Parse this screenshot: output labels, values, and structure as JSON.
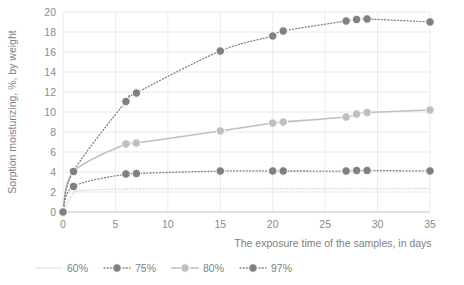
{
  "chart_data": {
    "type": "scatter",
    "title": "",
    "xlabel": "The exposure time of the samples, in days",
    "ylabel": "Sorption moisturizing, %, by weight",
    "xlim": [
      0,
      35
    ],
    "ylim": [
      0,
      20
    ],
    "xticks": [
      0,
      5,
      10,
      15,
      20,
      25,
      30,
      35
    ],
    "yticks": [
      0,
      2,
      4,
      6,
      8,
      10,
      12,
      14,
      16,
      18,
      20
    ],
    "grid": true,
    "legend_position": "bottom",
    "series": [
      {
        "name": "60%",
        "color": "#d9d9d9",
        "marker": "none",
        "line": "dotted",
        "x": [
          0,
          1,
          2,
          4,
          6,
          7,
          15,
          20,
          21,
          27,
          28,
          29,
          35
        ],
        "y": [
          0.0,
          1.9,
          2.15,
          2.25,
          2.3,
          2.3,
          2.32,
          2.33,
          2.33,
          2.34,
          2.34,
          2.34,
          2.35
        ]
      },
      {
        "name": "75%",
        "color": "#808080",
        "marker": "circle",
        "line": "dotted",
        "x": [
          0,
          1,
          6,
          7,
          15,
          20,
          21,
          27,
          28,
          29,
          35
        ],
        "y": [
          0.0,
          2.55,
          3.8,
          3.85,
          4.1,
          4.1,
          4.1,
          4.1,
          4.15,
          4.15,
          4.1
        ]
      },
      {
        "name": "80%",
        "color": "#bfbfbf",
        "marker": "circle",
        "line": "solid",
        "x": [
          0,
          1,
          6,
          7,
          15,
          20,
          21,
          27,
          28,
          29,
          35
        ],
        "y": [
          0.0,
          4.05,
          6.8,
          6.9,
          8.1,
          8.9,
          9.0,
          9.5,
          9.8,
          9.95,
          10.2
        ]
      },
      {
        "name": "97%",
        "color": "#808080",
        "marker": "circle",
        "line": "dotted",
        "x": [
          0,
          1,
          6,
          7,
          15,
          20,
          21,
          27,
          28,
          29,
          35
        ],
        "y": [
          0.0,
          4.05,
          11.05,
          11.9,
          16.1,
          17.6,
          18.1,
          19.1,
          19.25,
          19.3,
          19.0
        ]
      }
    ]
  },
  "legend": {
    "items": [
      {
        "label": "60%"
      },
      {
        "label": "75%"
      },
      {
        "label": "80%"
      },
      {
        "label": "97%"
      }
    ]
  }
}
